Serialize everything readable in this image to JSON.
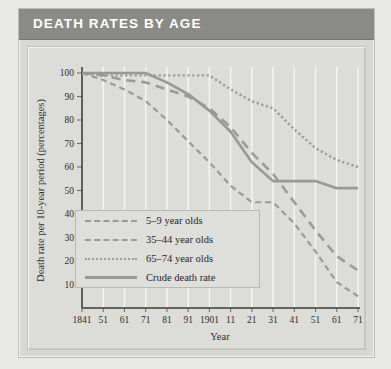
{
  "header": {
    "title": "DEATH RATES BY AGE"
  },
  "colors": {
    "header_bar": "#8a8a87",
    "header_text": "#ffffff",
    "panel_bg": "#dcdcd8",
    "plot_bg": "#dcdcd8",
    "gridline": "#f4f4f1",
    "series_line": "#9a9a97",
    "crude_line": "#98989a",
    "axis": "#3a3a38"
  },
  "chart_data": {
    "type": "line",
    "title": "DEATH RATES BY AGE",
    "xlabel": "Year",
    "ylabel": "Death rate per 10-year period (percentages)",
    "xlim": [
      1841,
      1971
    ],
    "ylim": [
      0,
      100
    ],
    "yticks": [
      10,
      20,
      30,
      40,
      50,
      60,
      70,
      80,
      90,
      100
    ],
    "ytick_labels": [
      "10",
      "20",
      "30",
      "40",
      "50",
      "60",
      "70",
      "80",
      "90",
      "100"
    ],
    "x": [
      1841,
      1851,
      1861,
      1871,
      1881,
      1891,
      1901,
      1911,
      1921,
      1931,
      1941,
      1951,
      1961,
      1971
    ],
    "xtick_labels": [
      "1841",
      "51",
      "61",
      "71",
      "81",
      "91",
      "1901",
      "11",
      "21",
      "31",
      "41",
      "51",
      "61",
      "71"
    ],
    "grid": "vertical",
    "legend_position": "lower-left",
    "series": [
      {
        "name": "5–9 year olds",
        "style": "fine-dashed",
        "values": [
          100,
          97,
          93,
          88,
          80,
          71,
          62,
          52,
          45,
          45,
          36,
          24,
          11,
          5
        ]
      },
      {
        "name": "35–44 year olds",
        "style": "dashed",
        "values": [
          100,
          99,
          97,
          96,
          93,
          90,
          85,
          77,
          66,
          57,
          45,
          33,
          22,
          16
        ]
      },
      {
        "name": "65–74 year olds",
        "style": "dotted",
        "values": [
          100,
          99,
          99,
          99,
          99,
          99,
          99,
          93,
          88,
          85,
          76,
          68,
          63,
          60
        ]
      },
      {
        "name": "Crude death rate",
        "style": "solid",
        "values": [
          100,
          100,
          100,
          100,
          96,
          91,
          84,
          75,
          62,
          54,
          54,
          54,
          51,
          51
        ]
      }
    ]
  },
  "legend": {
    "items": [
      {
        "label": "5–9 year olds",
        "key": "fine-dashed"
      },
      {
        "label": "35–44 year olds",
        "key": "dashed"
      },
      {
        "label": "65–74 year olds",
        "key": "dotted"
      },
      {
        "label": "Crude death rate",
        "key": "solid"
      }
    ]
  }
}
